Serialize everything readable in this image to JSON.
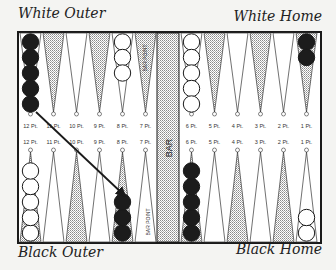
{
  "labels": {
    "white_outer": "White Outer",
    "white_home": "White Home",
    "black_outer": "Black Outer",
    "black_home": "Black Home",
    "bar": "BAR",
    "bar_point": "BAR POINT"
  },
  "colors": {
    "board_border": "#1a1a1a",
    "background": "#f4f4f2",
    "dark_checker": "#1c1c1c",
    "light_checker": "#ffffff",
    "stipple": "#9a9a9a"
  },
  "top_points": [
    {
      "label": "12 Pt.",
      "shade": "light",
      "checkers": {
        "color": "black",
        "count": 5
      }
    },
    {
      "label": "11 Pt.",
      "shade": "dotted",
      "checkers": null
    },
    {
      "label": "10 Pt.",
      "shade": "light",
      "checkers": null
    },
    {
      "label": "9 Pt.",
      "shade": "dotted",
      "checkers": null
    },
    {
      "label": "8 Pt.",
      "shade": "light",
      "checkers": {
        "color": "white",
        "count": 3
      }
    },
    {
      "label": "7 Pt.",
      "shade": "dotted",
      "checkers": null,
      "note": "BAR POINT"
    },
    {
      "label": "6 Pt.",
      "shade": "light",
      "checkers": {
        "color": "white",
        "count": 5
      }
    },
    {
      "label": "5 Pt.",
      "shade": "dotted",
      "checkers": null
    },
    {
      "label": "4 Pt.",
      "shade": "light",
      "checkers": null
    },
    {
      "label": "3 Pt.",
      "shade": "dotted",
      "checkers": null
    },
    {
      "label": "2 Pt.",
      "shade": "light",
      "checkers": null
    },
    {
      "label": "1 Pt.",
      "shade": "dotted",
      "checkers": {
        "color": "black",
        "count": 2
      }
    }
  ],
  "bottom_points": [
    {
      "label": "12 Pt.",
      "shade": "dotted",
      "checkers": {
        "color": "white",
        "count": 5
      }
    },
    {
      "label": "11 Pt.",
      "shade": "light",
      "checkers": null
    },
    {
      "label": "10 Pt.",
      "shade": "dotted",
      "checkers": null
    },
    {
      "label": "9 Pt.",
      "shade": "light",
      "checkers": null
    },
    {
      "label": "8 Pt.",
      "shade": "dotted",
      "checkers": {
        "color": "black",
        "count": 3
      }
    },
    {
      "label": "7 Pt.",
      "shade": "light",
      "checkers": null,
      "note": "BAR POINT"
    },
    {
      "label": "6 Pt.",
      "shade": "dotted",
      "checkers": {
        "color": "black",
        "count": 5
      }
    },
    {
      "label": "5 Pt.",
      "shade": "light",
      "checkers": null
    },
    {
      "label": "4 Pt.",
      "shade": "dotted",
      "checkers": null
    },
    {
      "label": "3 Pt.",
      "shade": "light",
      "checkers": null
    },
    {
      "label": "2 Pt.",
      "shade": "dotted",
      "checkers": null
    },
    {
      "label": "1 Pt.",
      "shade": "light",
      "checkers": {
        "color": "white",
        "count": 2
      }
    }
  ],
  "arrow": {
    "from": "top 12 Pt. (black checker)",
    "to": "bottom 8 Pt."
  }
}
